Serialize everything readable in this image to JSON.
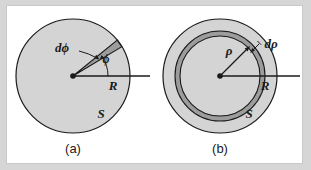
{
  "figure": {
    "background_color": "#d6d6d6",
    "panel_color": "#ffffff",
    "disk_fill": "#d4d4d4",
    "element_fill": "#9c9c9c",
    "stroke_color": "#1a1a1a"
  },
  "diagram_a": {
    "caption": "(a)",
    "label_dphi": "dϕ",
    "label_phi": "ϕ",
    "label_R": "R",
    "label_S": "S",
    "shape": "disk-with-angular-wedge",
    "center": [
      73,
      76
    ],
    "radius": 57,
    "wedge_start_deg": 31,
    "wedge_end_deg": 39
  },
  "diagram_b": {
    "caption": "(b)",
    "label_rho": "ρ",
    "label_drho": "dρ",
    "label_R": "R",
    "label_S": "S",
    "shape": "disk-with-annular-ring",
    "center": [
      220,
      76
    ],
    "radius": 57,
    "ring_inner_radius": 40,
    "ring_outer_radius": 45
  }
}
